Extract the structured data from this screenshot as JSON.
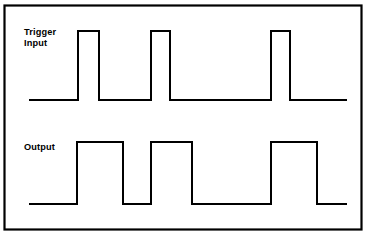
{
  "figure": {
    "kind": "timing-diagram",
    "background_color": "#ffffff",
    "line_color": "#000000",
    "border": {
      "x": 4.5,
      "y": 5.5,
      "width": 357,
      "height": 224,
      "stroke_width": 2.2,
      "color": "#000000"
    },
    "width": 370,
    "height": 238
  },
  "waveforms": [
    {
      "id": "trigger-input",
      "label_lines": [
        "Trigger",
        "Input"
      ],
      "label_x": 24,
      "label_y_first": 35,
      "label_line_height": 11,
      "baseline_y": 100,
      "high_y": 31,
      "x_start": 29,
      "x_end": 347,
      "stroke_width": 2.0,
      "pulses": [
        {
          "rise_x": 78,
          "fall_x": 99
        },
        {
          "rise_x": 151,
          "fall_x": 170
        },
        {
          "rise_x": 271,
          "fall_x": 290
        }
      ]
    },
    {
      "id": "output",
      "label_lines": [
        "Output"
      ],
      "label_x": 24,
      "label_y_first": 150,
      "label_line_height": 11,
      "baseline_y": 204,
      "high_y": 142,
      "x_start": 29,
      "x_end": 347,
      "stroke_width": 2.0,
      "pulses": [
        {
          "rise_x": 77,
          "fall_x": 123
        },
        {
          "rise_x": 151,
          "fall_x": 192
        },
        {
          "rise_x": 271,
          "fall_x": 317
        }
      ]
    }
  ],
  "labels": {
    "trigger_line1": "Trigger",
    "trigger_line2": "Input",
    "output_line1": "Output"
  }
}
